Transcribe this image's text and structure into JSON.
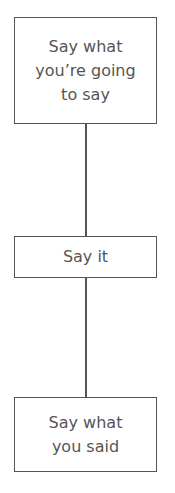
{
  "diagram": {
    "nodes": [
      {
        "id": "n1",
        "lines": [
          "Say what",
          "you’re going",
          "to say"
        ]
      },
      {
        "id": "n2",
        "lines": [
          "Say it"
        ]
      },
      {
        "id": "n3",
        "lines": [
          "Say what",
          "you said"
        ]
      }
    ],
    "edges": [
      [
        "n1",
        "n2"
      ],
      [
        "n2",
        "n3"
      ]
    ],
    "colors": {
      "stroke": "#555555",
      "text": "#555555",
      "background": "#ffffff"
    }
  }
}
